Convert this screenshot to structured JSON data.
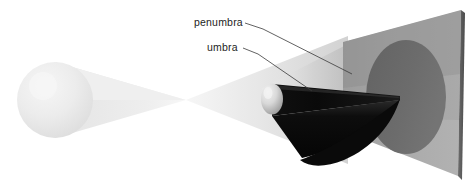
{
  "figure": {
    "type": "optics-diagram",
    "background_color": "#ffffff",
    "width": 474,
    "height": 186
  },
  "labels": [
    {
      "id": "penumbra",
      "text": "penumbra",
      "text_x": 194,
      "text_y": 26,
      "leader": {
        "x1": 245,
        "y1": 23,
        "x2": 263,
        "y2": 29,
        "x3": 352,
        "y3": 74
      },
      "color": "#1d1d1d"
    },
    {
      "id": "umbra",
      "text": "umbra",
      "text_x": 207,
      "text_y": 51,
      "leader": {
        "x1": 243,
        "y1": 48,
        "x2": 258,
        "y2": 54,
        "x3": 312,
        "y3": 91
      },
      "color": "#1d1d1d"
    }
  ],
  "objects": {
    "light_source": {
      "name": "light-source-sphere",
      "cx": 55,
      "cy": 100,
      "r": 38,
      "fill": "#e9e9e9",
      "highlight": "#f4f4f4"
    },
    "occluder": {
      "name": "occluding-sphere",
      "cx": 272,
      "cy": 99,
      "rx": 10,
      "ry": 15,
      "fill": "#d9d9d9",
      "highlight": "#f0f0f0"
    },
    "screen": {
      "name": "projection-screen",
      "fill": "#a9a9a9",
      "edge_fill": "#5e5e5e",
      "corners": [
        {
          "x": 343,
          "y": 42
        },
        {
          "x": 461,
          "y": 10
        },
        {
          "x": 458,
          "y": 176
        },
        {
          "x": 343,
          "y": 131
        }
      ],
      "edge_corners": [
        {
          "x": 461,
          "y": 10
        },
        {
          "x": 465,
          "y": 13
        },
        {
          "x": 462,
          "y": 180
        },
        {
          "x": 458,
          "y": 176
        }
      ]
    },
    "shadow_disc": {
      "name": "shadow-disc-on-screen",
      "cx": 406,
      "cy": 97,
      "rx": 40,
      "ry": 57,
      "fill": "#6b6b6b"
    }
  },
  "regions": {
    "light_cone": {
      "name": "light-cone",
      "fill": "#ebebeb",
      "crossover_x": 186,
      "crossover_y": 100
    },
    "penumbra_cone": {
      "name": "penumbra-cone",
      "fill": "#d5d5d5"
    },
    "umbra_cone": {
      "name": "umbra-cone",
      "fill": "#0b0b0b",
      "apex_x": 400,
      "apex_y": 98
    }
  }
}
